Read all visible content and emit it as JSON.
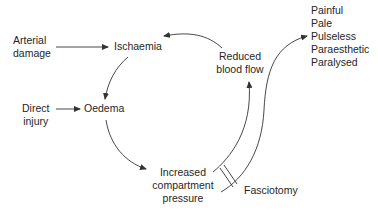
{
  "diagram": {
    "type": "cycle-flow",
    "nodes": {
      "arterial_damage": {
        "line1": "Arterial",
        "line2": "damage"
      },
      "ischaemia": {
        "label": "Ischaemia"
      },
      "direct_injury": {
        "line1": "Direct",
        "line2": "injury"
      },
      "oedema": {
        "label": "Oedema"
      },
      "increased_pressure": {
        "line1": "Increased",
        "line2": "compartment",
        "line3": "pressure"
      },
      "reduced_blood_flow": {
        "line1": "Reduced",
        "line2": "blood flow"
      },
      "fasciotomy": {
        "label": "Fasciotomy"
      },
      "symptoms": {
        "items": [
          "Painful",
          "Pale",
          "Pulseless",
          "Paraesthetic",
          "Paralysed"
        ]
      }
    },
    "edges": [
      {
        "from": "Arterial damage",
        "to": "Ischaemia"
      },
      {
        "from": "Direct injury",
        "to": "Oedema"
      },
      {
        "from": "Ischaemia",
        "to": "Oedema"
      },
      {
        "from": "Oedema",
        "to": "Increased compartment pressure"
      },
      {
        "from": "Increased compartment pressure",
        "to": "Reduced blood flow"
      },
      {
        "from": "Reduced blood flow",
        "to": "Ischaemia"
      },
      {
        "from": "Increased compartment pressure",
        "to": "Painful / Pale / Pulseless / Paraesthetic / Paralysed"
      }
    ],
    "interruption": {
      "label": "Fasciotomy",
      "marker": "double-slash across paths"
    },
    "colors": {
      "line": "#333333",
      "text": "#262626",
      "background": "#ffffff"
    }
  }
}
